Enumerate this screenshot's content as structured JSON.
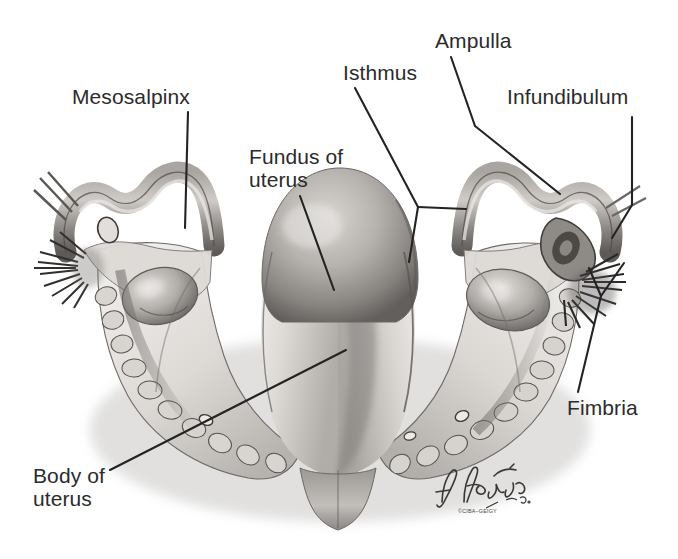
{
  "figure": {
    "kind": "anatomical-illustration",
    "background_color": "#ffffff",
    "ink_color": "#2b2b2b",
    "tissue_light": "#e6e4e1",
    "tissue_mid": "#b9b6b2",
    "tissue_dark": "#6f6c69",
    "tissue_shadow": "#3f3d3b"
  },
  "labels": {
    "mesosalpinx": "Mesosalpinx",
    "fundus_of_uterus": "Fundus of\nuterus",
    "isthmus": "Isthmus",
    "ampulla": "Ampulla",
    "infundibulum": "Infundibulum",
    "fimbria": "Fimbria",
    "body_of_uterus": "Body of\nuterus"
  },
  "credit": {
    "artist_signature": "F. Netter",
    "artist_suffix": "M.D.",
    "copyright": "©CIBA–GEIGY"
  },
  "leader_lines": [
    {
      "name": "mesosalpinx-leader",
      "points": "188,112 185,228"
    },
    {
      "name": "fundus-leader",
      "points": "300,196 334,290"
    },
    {
      "name": "isthmus-leader",
      "points": "355,88 418,207"
    },
    {
      "name": "isthmus-branch-right",
      "points": "418,207 466,209"
    },
    {
      "name": "isthmus-branch-down",
      "points": "418,207 409,262"
    },
    {
      "name": "ampulla-leader",
      "points": "451,57 475,126"
    },
    {
      "name": "ampulla-branch",
      "points": "475,126 560,194"
    },
    {
      "name": "infundibulum-leader",
      "points": "632,117 632,205 612,238"
    },
    {
      "name": "fimbria-stem",
      "points": "578,392 601,296"
    },
    {
      "name": "fimbria-branch-left",
      "points": "601,296 589,268"
    },
    {
      "name": "fimbria-branch-right",
      "points": "601,296 624,263"
    },
    {
      "name": "body-leader",
      "points": "110,470 346,350"
    }
  ]
}
